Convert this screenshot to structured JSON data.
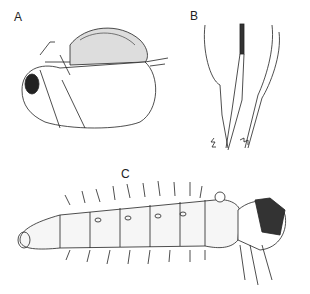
{
  "figure": {
    "panels": [
      {
        "label": "A",
        "subject": "adult-insect-lateral-view"
      },
      {
        "label": "B",
        "subject": "appendage-detail"
      },
      {
        "label": "C",
        "subject": "larva-lateral-view"
      }
    ]
  }
}
